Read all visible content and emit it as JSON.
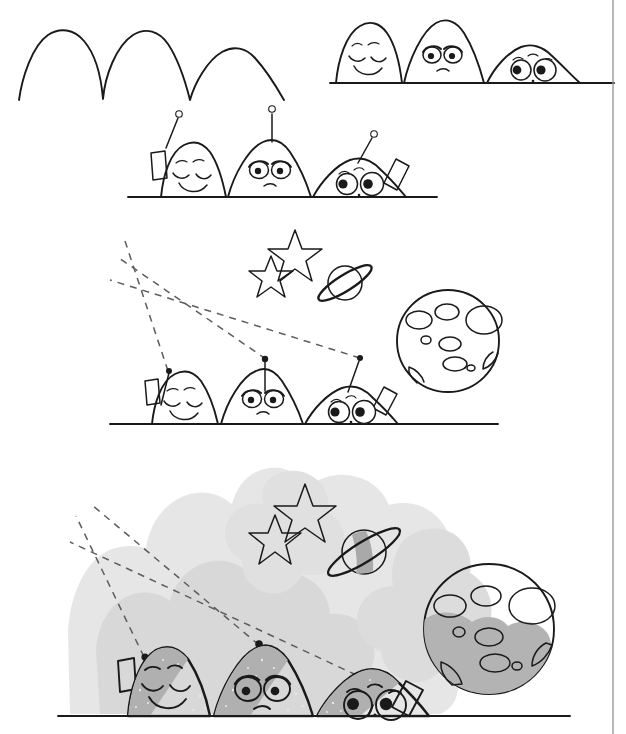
{
  "illustration": {
    "title": "Draw aliens / moon-base hills step-by-step",
    "type": "step-by-step line drawing tutorial",
    "panel_count": 5,
    "background_color": "#ffffff",
    "ink_color": "#1a1a1a",
    "dash_color": "#5d5d5d",
    "shade_light": "#e2e2e2",
    "shade_mid": "#c9c9c9",
    "shade_dark": "#a8a8a8",
    "border": {
      "right_rule": true,
      "color": "#9a9a9a"
    }
  },
  "palette": {
    "paper": "#ffffff",
    "ink": "#1a1a1a",
    "dash": "#5d5d5d",
    "sky_wash": "#e4e4e4",
    "sky_wash_2": "#d6d6d6",
    "hill_gray": "#9e9e9e",
    "hill_gray_light": "#b5b5b5",
    "moon_gray": "#b0b0b0",
    "crater_light": "#ededed",
    "star_gray": "#cfcfcf",
    "planet_gray": "#bdbdbd"
  },
  "panels": [
    {
      "id": "panel-1",
      "step": 1,
      "label": "Step 1 - three bare hill outlines",
      "contents": [
        "hill-outline-left",
        "hill-outline-middle",
        "hill-outline-right"
      ],
      "has_faces": false,
      "has_ground_line": false,
      "has_antennas": false,
      "has_sky": false,
      "shaded": false
    },
    {
      "id": "panel-2",
      "step": 2,
      "label": "Step 2 - add faces and ground line",
      "contents": [
        "hill-happy",
        "hill-grumpy",
        "hill-surprised",
        "ground-line"
      ],
      "has_faces": true,
      "has_ground_line": true,
      "has_antennas": false,
      "has_sky": false,
      "shaded": false
    },
    {
      "id": "panel-3",
      "step": 3,
      "label": "Step 3 - add antennas and solar panels",
      "contents": [
        "antenna-left",
        "antenna-middle",
        "antenna-right",
        "solar-panel-left",
        "solar-panel-right",
        "ground-line"
      ],
      "has_faces": true,
      "has_ground_line": true,
      "has_antennas": true,
      "has_sky": false,
      "shaded": false
    },
    {
      "id": "panel-4",
      "step": 4,
      "label": "Step 4 - add signal beams, stars, ringed planet and moon",
      "contents": [
        "signal-beam-1",
        "signal-beam-2",
        "signal-beam-3",
        "star-small",
        "star-large",
        "ringed-planet",
        "moon",
        "ground-line"
      ],
      "has_faces": true,
      "has_ground_line": true,
      "has_antennas": true,
      "has_sky": true,
      "shaded": false
    },
    {
      "id": "panel-5",
      "step": 5,
      "label": "Step 5 - finished drawing with gray shading",
      "contents": [
        "sky-wash",
        "signal-beam-1",
        "signal-beam-2",
        "signal-beam-3",
        "star-small",
        "star-large",
        "ringed-planet",
        "moon",
        "hill-happy",
        "hill-grumpy",
        "hill-surprised",
        "ground-line"
      ],
      "has_faces": true,
      "has_ground_line": true,
      "has_antennas": true,
      "has_sky": true,
      "shaded": true
    }
  ],
  "characters": [
    {
      "id": "hill-happy",
      "position": "left",
      "expression": "happy",
      "eyes": "closed-curved-smiling",
      "eyebrows": "two short dashes",
      "mouth": "wide smile",
      "antenna": {
        "present_from_step": 3,
        "tilt": "left",
        "tip": "small-circle"
      },
      "solar_panel": {
        "present_from_step": 3,
        "side": "left"
      }
    },
    {
      "id": "hill-grumpy",
      "position": "middle",
      "expression": "grumpy",
      "eyes": "large oval with heavy droopy upper lids",
      "eyebrows": "angled lids",
      "mouth": "small frown",
      "antenna": {
        "present_from_step": 3,
        "tilt": "straight-up",
        "tip": "small-circle"
      },
      "solar_panel": {
        "present_from_step": 3,
        "side": "none"
      }
    },
    {
      "id": "hill-surprised",
      "position": "right",
      "expression": "surprised",
      "eyes": "two large round wide eyes, pupils looking apart",
      "eyebrows": "two short dashes",
      "mouth": "tiny dot",
      "antenna": {
        "present_from_step": 3,
        "tilt": "right",
        "tip": "small-circle"
      },
      "solar_panel": {
        "present_from_step": 3,
        "side": "right"
      }
    }
  ],
  "sky_objects": [
    {
      "id": "star-small",
      "type": "five-point-star",
      "size": "small",
      "from_step": 4
    },
    {
      "id": "star-large",
      "type": "five-point-star",
      "size": "large",
      "from_step": 4
    },
    {
      "id": "ringed-planet",
      "type": "saturn-with-ring",
      "from_step": 4
    },
    {
      "id": "moon",
      "type": "cratered-moon",
      "crater_count": 10,
      "from_step": 4
    }
  ],
  "signal_beams": {
    "count": 3,
    "style": "dashed",
    "direction": "up and to the left",
    "origin": "antenna tips",
    "from_step": 4
  }
}
